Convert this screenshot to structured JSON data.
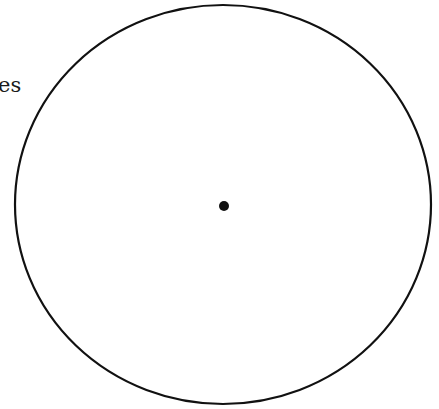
{
  "label_fragment": "es",
  "figure": {
    "circle": {
      "cx": 223,
      "cy": 204.5,
      "rx": 208,
      "ry": 199.5,
      "stroke": "#111111",
      "stroke_width": 2.2
    },
    "center_dot": {
      "cx": 224,
      "cy": 206,
      "r": 5,
      "fill": "#111111"
    }
  }
}
